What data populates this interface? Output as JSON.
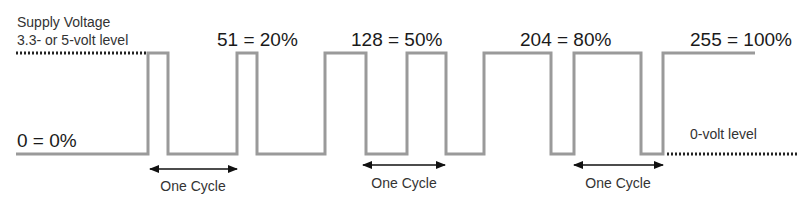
{
  "labels": {
    "supply_voltage": "Supply Voltage",
    "supply_level": "3.3- or 5-volt level",
    "zero_volt": "0-volt level",
    "zero_value": "0 = 0%",
    "one_cycle": "One Cycle"
  },
  "duty_labels": [
    {
      "value": 51,
      "percent": "20%",
      "text": "51 = 20%"
    },
    {
      "value": 128,
      "percent": "50%",
      "text": "128 = 50%"
    },
    {
      "value": 204,
      "percent": "80%",
      "text": "204 = 80%"
    },
    {
      "value": 255,
      "percent": "100%",
      "text": "255 = 100%"
    }
  ],
  "cycle_labels": [
    "One Cycle",
    "One Cycle",
    "One Cycle"
  ],
  "colors": {
    "waveform": "#9a9a9a",
    "dotted_reference": "#222222",
    "text": "#1a1a1a",
    "background": "#ffffff"
  }
}
